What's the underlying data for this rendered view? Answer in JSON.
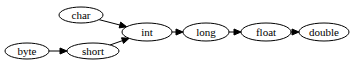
{
  "diagram": {
    "type": "directed-graph",
    "nodes": [
      {
        "id": "char",
        "label": "char",
        "cx": 81,
        "cy": 15,
        "rx": 22,
        "ry": 8
      },
      {
        "id": "byte",
        "label": "byte",
        "cx": 27,
        "cy": 51,
        "rx": 22,
        "ry": 8
      },
      {
        "id": "short",
        "label": "short",
        "cx": 93,
        "cy": 51,
        "rx": 26,
        "ry": 8
      },
      {
        "id": "int",
        "label": "int",
        "cx": 147,
        "cy": 32,
        "rx": 25,
        "ry": 9
      },
      {
        "id": "long",
        "label": "long",
        "cx": 206,
        "cy": 32,
        "rx": 23,
        "ry": 9
      },
      {
        "id": "float",
        "label": "float",
        "cx": 266,
        "cy": 32,
        "rx": 25,
        "ry": 9
      },
      {
        "id": "double",
        "label": "double",
        "cx": 324,
        "cy": 32,
        "rx": 25,
        "ry": 9
      }
    ],
    "edges": [
      {
        "from": "char",
        "to": "int"
      },
      {
        "from": "byte",
        "to": "short"
      },
      {
        "from": "short",
        "to": "int"
      },
      {
        "from": "int",
        "to": "long"
      },
      {
        "from": "long",
        "to": "float"
      },
      {
        "from": "float",
        "to": "double"
      }
    ],
    "colors": {
      "stroke": "#000000",
      "fill": "#ffffff",
      "text": "#000000"
    }
  }
}
